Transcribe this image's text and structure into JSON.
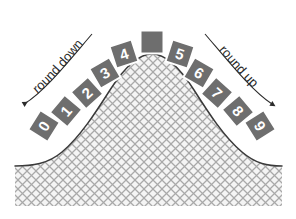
{
  "diagram": {
    "canvas": {
      "width": 296,
      "height": 219,
      "background": "#ffffff"
    },
    "curve": {
      "name": "bell-curve",
      "stroke": "#3a3a3a",
      "fill_pattern": "cross-hatch",
      "fill_color": "#f2f2f2",
      "hatch_color": "#a8a8a8"
    },
    "annotations": [
      {
        "id": "round-down",
        "text": "round down",
        "side": "left",
        "arrow": "leftward"
      },
      {
        "id": "round-up",
        "text": "round up",
        "side": "right",
        "arrow": "rightward"
      }
    ],
    "tiles": [
      {
        "label": "0",
        "x": 44,
        "y": 126,
        "rotate": -58,
        "blank": false
      },
      {
        "label": "1",
        "x": 66,
        "y": 111,
        "rotate": -50,
        "blank": false
      },
      {
        "label": "2",
        "x": 87,
        "y": 93,
        "rotate": -42,
        "blank": false
      },
      {
        "label": "3",
        "x": 105,
        "y": 73,
        "rotate": -30,
        "blank": false
      },
      {
        "label": "4",
        "x": 124,
        "y": 54,
        "rotate": -18,
        "blank": false
      },
      {
        "label": "",
        "x": 152,
        "y": 42,
        "rotate": 0,
        "blank": true
      },
      {
        "label": "5",
        "x": 180,
        "y": 54,
        "rotate": 18,
        "blank": false
      },
      {
        "label": "6",
        "x": 199,
        "y": 73,
        "rotate": 30,
        "blank": false
      },
      {
        "label": "7",
        "x": 217,
        "y": 93,
        "rotate": 42,
        "blank": false
      },
      {
        "label": "8",
        "x": 238,
        "y": 111,
        "rotate": 50,
        "blank": false
      },
      {
        "label": "9",
        "x": 260,
        "y": 126,
        "rotate": 58,
        "blank": false
      }
    ],
    "tile_style": {
      "fill": "#6e6e6e",
      "stroke": "#ffffff",
      "size": 23,
      "text_color": "#ffffff"
    }
  }
}
